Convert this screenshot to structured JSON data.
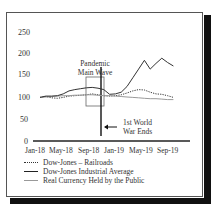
{
  "chart_data": {
    "type": "line",
    "title": "",
    "xlabel": "",
    "ylabel": "",
    "ylim": [
      0,
      250
    ],
    "yticks": [
      0,
      50,
      100,
      150,
      200,
      250
    ],
    "xtick_labels": [
      "Jan-18",
      "May-18",
      "Sep-18",
      "Jan-19",
      "May-19",
      "Sep-19"
    ],
    "grid": false,
    "legend_position": "bottom",
    "x": [
      "Jan-18",
      "Feb-18",
      "Mar-18",
      "Apr-18",
      "May-18",
      "Jun-18",
      "Jul-18",
      "Aug-18",
      "Sep-18",
      "Oct-18",
      "Nov-18",
      "Dec-18",
      "Jan-19",
      "Feb-19",
      "Mar-19",
      "Apr-19",
      "May-19",
      "Jun-19",
      "Jul-19",
      "Aug-19",
      "Sep-19",
      "Oct-19",
      "Nov-19",
      "Dec-19"
    ],
    "series": [
      {
        "name": "Dow-Jones – Railroads",
        "style": "dotted",
        "values": [
          100,
          102,
          99,
          98,
          100,
          103,
          104,
          105,
          106,
          108,
          106,
          104,
          103,
          104,
          106,
          110,
          115,
          118,
          117,
          112,
          108,
          107,
          104,
          100
        ]
      },
      {
        "name": "Dow-Jones Industrial Average",
        "style": "solid",
        "values": [
          100,
          103,
          103,
          104,
          108,
          115,
          118,
          120,
          122,
          123,
          121,
          118,
          107,
          108,
          112,
          125,
          145,
          165,
          185,
          165,
          178,
          190,
          180,
          172
        ]
      },
      {
        "name": "Real Currency Held by the Public",
        "style": "light",
        "values": [
          100,
          101,
          102,
          103,
          104,
          104,
          105,
          105,
          106,
          106,
          105,
          104,
          104,
          103,
          102,
          101,
          100,
          99,
          98,
          97,
          97,
          96,
          95,
          95
        ]
      }
    ],
    "annotations": [
      {
        "text": "Pandemic Main Wave",
        "type": "box",
        "x_range": [
          "Sep-18",
          "Dec-18"
        ]
      },
      {
        "text": "1st World War Ends",
        "type": "arrow-line",
        "x": "Nov-18"
      }
    ]
  },
  "labels": {
    "y": [
      "250",
      "200",
      "150",
      "100",
      "50",
      "0"
    ],
    "x": [
      "Jan-18",
      "May-18",
      "Sep-18",
      "Jan-19",
      "May-19",
      "Sep-19"
    ],
    "pandemic_line1": "Pandemic",
    "pandemic_line2": "Main Wave",
    "war_line1": "1st World",
    "war_line2": "War Ends"
  },
  "legend": [
    {
      "label": "Dow-Jones – Railroads"
    },
    {
      "label": "Dow-Jones Industrial Average"
    },
    {
      "label": "Real Currency Held by the Public"
    }
  ]
}
